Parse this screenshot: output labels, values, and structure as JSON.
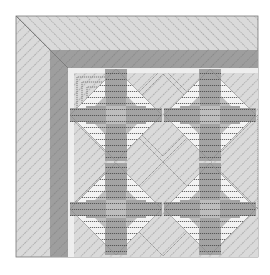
{
  "image": {
    "subject": "quilt corner illustration",
    "description": "Corner of a quilt with a wide diagonal-striped light border, a dark mitered band, and a 2x2 grid of on-point blocks"
  },
  "colors": {
    "background": "#ffffff",
    "light_fabric": "#d9d9d9",
    "light_stripe": "#8a8a8a",
    "dark_band": "#9c9c9c",
    "mid_gray": "#a8a8a8",
    "dark_gray": "#8c8c8c",
    "white_fabric": "#f4f4f4",
    "stitch_line": "#555555",
    "outline": "#666666"
  },
  "layout": {
    "quilt_left": 16,
    "quilt_top": 16,
    "quilt_right": 258,
    "quilt_bottom": 257,
    "outer_border_width": 34,
    "dark_band_width": 18,
    "inner_start": 68,
    "block_grid": {
      "rows": 2,
      "cols": 2,
      "block_size": 95,
      "origin": 68
    }
  }
}
